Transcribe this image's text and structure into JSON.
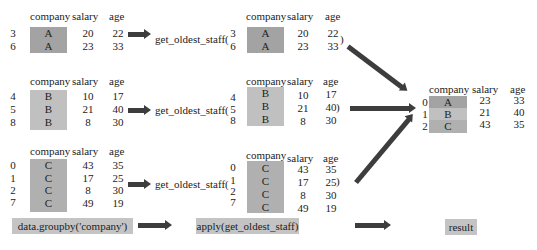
{
  "groups": [
    {
      "key": "A",
      "headers": {
        "company": "company",
        "salary": "salary",
        "age": "age"
      },
      "rows": [
        {
          "index": "3",
          "company": "A",
          "salary": "20",
          "age": "22"
        },
        {
          "index": "6",
          "company": "A",
          "salary": "23",
          "age": "33"
        }
      ],
      "function_call": "get_oldest_staff(",
      "close_paren": ")"
    },
    {
      "key": "B",
      "headers": {
        "company": "company",
        "salary": "salary",
        "age": "age"
      },
      "rows": [
        {
          "index": "4",
          "company": "B",
          "salary": "10",
          "age": "17"
        },
        {
          "index": "5",
          "company": "B",
          "salary": "21",
          "age": "40"
        },
        {
          "index": "8",
          "company": "B",
          "salary": "8",
          "age": "30"
        }
      ],
      "function_call": "get_oldest_staff(",
      "close_paren": ")"
    },
    {
      "key": "C",
      "headers": {
        "company": "company",
        "salary": "salary",
        "age": "age"
      },
      "rows": [
        {
          "index": "0",
          "company": "C",
          "salary": "43",
          "age": "35"
        },
        {
          "index": "1",
          "company": "C",
          "salary": "17",
          "age": "25"
        },
        {
          "index": "2",
          "company": "C",
          "salary": "8",
          "age": "30"
        },
        {
          "index": "7",
          "company": "C",
          "salary": "49",
          "age": "19"
        }
      ],
      "function_call": "get_oldest_staff(",
      "close_paren": ")"
    }
  ],
  "result": {
    "headers": {
      "company": "company",
      "salary": "salary",
      "age": "age"
    },
    "rows": [
      {
        "index": "0",
        "company": "A",
        "salary": "23",
        "age": "33"
      },
      {
        "index": "1",
        "company": "B",
        "salary": "21",
        "age": "40"
      },
      {
        "index": "2",
        "company": "C",
        "salary": "43",
        "age": "35"
      }
    ]
  },
  "steps": {
    "groupby": "data.groupby('company')",
    "apply": "apply(get_oldest_staff)",
    "result": "result"
  },
  "colors": {
    "shade_a": "#a3a3a3",
    "shade_b": "#c0c0c0",
    "shade_c": "#b0b0b0",
    "arrow": "#3d3d3d",
    "label_bg": "#c4c4c4"
  }
}
